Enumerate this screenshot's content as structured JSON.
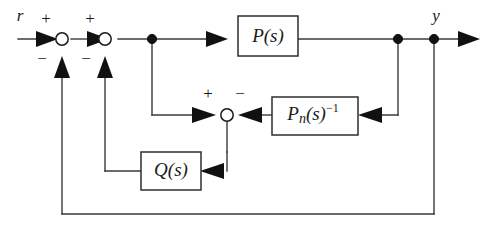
{
  "diagram": {
    "background_color": "#ffffff",
    "line_color": "#3a3a3a",
    "text_color": "#1a1a1a",
    "signals": {
      "input_label": "r",
      "output_label": "y"
    },
    "blocks": [
      {
        "id": "plant",
        "name": "plant-block",
        "label_main": "P",
        "label_paren": "(s)",
        "label_sub": "",
        "label_sup": ""
      },
      {
        "id": "nominal-inverse",
        "name": "nominal-plant-inverse-block",
        "label_main": "P",
        "label_paren": "(s)",
        "label_sub": "n",
        "label_sup": "−1"
      },
      {
        "id": "filter",
        "name": "q-filter-block",
        "label_main": "Q",
        "label_paren": "(s)",
        "label_sub": "",
        "label_sup": ""
      }
    ],
    "summing_junctions": [
      {
        "id": "sum-outer",
        "name": "summing-junction-outer",
        "plus": "+",
        "minus": "−"
      },
      {
        "id": "sum-inner",
        "name": "summing-junction-inner",
        "plus": "+",
        "minus": "−"
      },
      {
        "id": "sum-observer",
        "name": "summing-junction-observer",
        "plus": "+",
        "minus": "−"
      }
    ]
  }
}
